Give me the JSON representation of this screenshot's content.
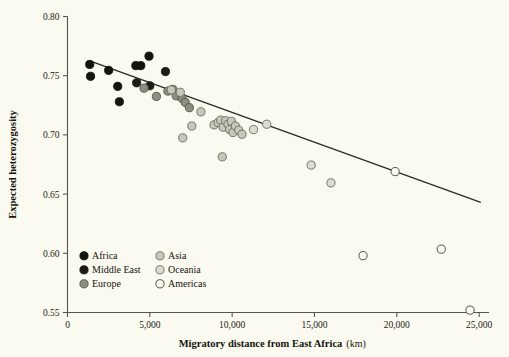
{
  "chart_data": {
    "type": "scatter",
    "title": "",
    "xlabel": "Migratory distance from East Africa",
    "xunit": "(km)",
    "ylabel": "Expected heterozygosity",
    "xlim": [
      0,
      25600
    ],
    "ylim": [
      0.55,
      0.8
    ],
    "xticks": [
      0,
      5000,
      10000,
      15000,
      20000,
      25000
    ],
    "xticklabels": [
      "0",
      "5,000",
      "10,000",
      "15,000",
      "20,000",
      "25,000"
    ],
    "yticks": [
      0.55,
      0.6,
      0.65,
      0.7,
      0.75,
      0.8
    ],
    "yticklabels": [
      "0.55",
      "0.60",
      "0.65",
      "0.70",
      "0.75",
      "0.80"
    ],
    "grid": false,
    "legend_position": "lower-left-inside",
    "trendline": {
      "name": "linear regression fit",
      "x_start": 1350,
      "y_start": 0.7625,
      "x_end": 25100,
      "y_end": 0.643
    },
    "series": [
      {
        "name": "Africa",
        "marker": "filled-circle",
        "color": "#14140f",
        "edge": "#14140f",
        "points": [
          [
            1350,
            0.7595
          ],
          [
            1400,
            0.7495
          ],
          [
            2500,
            0.7545
          ],
          [
            3050,
            0.741
          ],
          [
            3150,
            0.728
          ],
          [
            4150,
            0.7585
          ],
          [
            4450,
            0.7585
          ],
          [
            4950,
            0.7665
          ]
        ]
      },
      {
        "name": "Middle East",
        "marker": "filled-circle",
        "color": "#1c1c15",
        "edge": "#1c1c15",
        "points": [
          [
            4200,
            0.744
          ],
          [
            5000,
            0.7415
          ],
          [
            5950,
            0.7535
          ]
        ]
      },
      {
        "name": "Europe",
        "marker": "filled-circle",
        "color": "#8d8d80",
        "edge": "#55554a",
        "points": [
          [
            4650,
            0.7395
          ],
          [
            5400,
            0.7325
          ],
          [
            6100,
            0.737
          ],
          [
            6400,
            0.7385
          ],
          [
            6600,
            0.733
          ],
          [
            6950,
            0.731
          ],
          [
            7150,
            0.7275
          ],
          [
            7400,
            0.723
          ]
        ]
      },
      {
        "name": "Asia",
        "marker": "filled-circle",
        "color": "#c8c8ba",
        "edge": "#6b6b5e",
        "points": [
          [
            6300,
            0.738
          ],
          [
            6850,
            0.736
          ],
          [
            7000,
            0.6975
          ],
          [
            7550,
            0.7075
          ],
          [
            8100,
            0.7195
          ],
          [
            8900,
            0.7085
          ],
          [
            9150,
            0.7105
          ],
          [
            9300,
            0.7125
          ],
          [
            9450,
            0.7065
          ],
          [
            9600,
            0.712
          ],
          [
            9750,
            0.709
          ],
          [
            9850,
            0.7045
          ],
          [
            9950,
            0.7115
          ],
          [
            10050,
            0.702
          ],
          [
            10200,
            0.7075
          ],
          [
            10400,
            0.704
          ],
          [
            10600,
            0.7005
          ],
          [
            9400,
            0.6815
          ]
        ]
      },
      {
        "name": "Oceania",
        "marker": "open-circle-gray",
        "color": "#dcdcd0",
        "edge": "#6b6b5e",
        "points": [
          [
            11300,
            0.7045
          ],
          [
            12100,
            0.709
          ],
          [
            14800,
            0.6745
          ],
          [
            16000,
            0.6595
          ]
        ]
      },
      {
        "name": "Americas",
        "marker": "open-circle",
        "color": "#fbfaf0",
        "edge": "#44443a",
        "points": [
          [
            17950,
            0.598
          ],
          [
            19900,
            0.669
          ],
          [
            22700,
            0.6035
          ],
          [
            24450,
            0.552
          ]
        ]
      }
    ]
  },
  "legend": {
    "entries": [
      {
        "label": "Africa",
        "color": "#14140f",
        "edge": "#14140f"
      },
      {
        "label": "Middle East",
        "color": "#1c1c15",
        "edge": "#1c1c15"
      },
      {
        "label": "Europe",
        "color": "#8d8d80",
        "edge": "#55554a"
      },
      {
        "label": "Asia",
        "color": "#c8c8ba",
        "edge": "#6b6b5e"
      },
      {
        "label": "Oceania",
        "color": "#dcdcd0",
        "edge": "#6b6b5e"
      },
      {
        "label": "Americas",
        "color": "#fbfaf0",
        "edge": "#44443a"
      }
    ]
  }
}
